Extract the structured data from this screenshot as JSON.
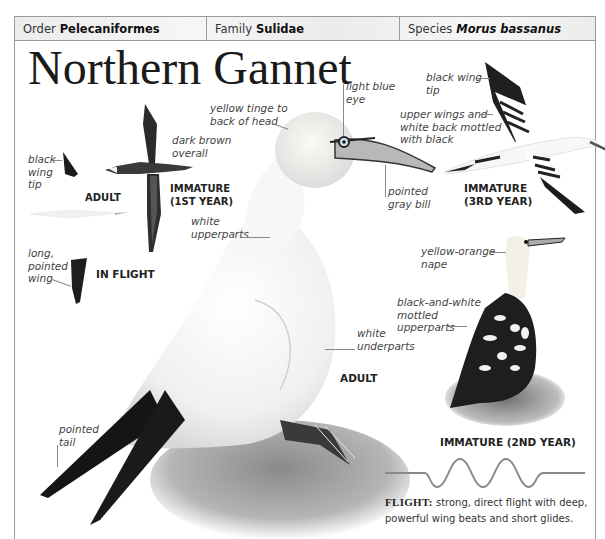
{
  "taxonomy": {
    "order_label": "Order",
    "order_value": "Pelecaniformes",
    "family_label": "Family",
    "family_value": "Sulidae",
    "species_label": "Species",
    "species_value": "Morus bassanus"
  },
  "title": "Northern Gannet",
  "in_flight": {
    "caption": "IN FLIGHT",
    "adult_caption": "ADULT",
    "immature_caption_line1": "IMMATURE",
    "immature_caption_line2": "(1ST YEAR)",
    "labels": {
      "black_wing_tip": [
        "black",
        "wing",
        "tip"
      ],
      "long_pointed_wing": [
        "long,",
        "pointed",
        "wing"
      ],
      "dark_brown_overall": [
        "dark brown",
        "overall"
      ]
    }
  },
  "adult": {
    "caption": "ADULT",
    "labels": {
      "yellow_tinge": [
        "yellow tinge to",
        "back of head"
      ],
      "light_blue_eye": [
        "light blue",
        "eye"
      ],
      "pointed_gray_bill": [
        "pointed",
        "gray bill"
      ],
      "white_upperparts": [
        "white",
        "upperparts"
      ],
      "white_underparts": [
        "white",
        "underparts"
      ],
      "pointed_tail": [
        "pointed",
        "tail"
      ]
    }
  },
  "immature_3rd": {
    "caption_line1": "IMMATURE",
    "caption_line2": "(3RD YEAR)",
    "labels": {
      "black_wing_tip": [
        "black wing",
        "tip"
      ],
      "upper_wings": [
        "upper wings and",
        "white back mottled",
        "with black"
      ]
    }
  },
  "immature_2nd": {
    "caption": "IMMATURE (2ND YEAR)",
    "labels": {
      "nape": [
        "yellow-orange",
        "nape"
      ],
      "mottled": [
        "black-and-white",
        "mottled",
        "upperparts"
      ]
    }
  },
  "flight": {
    "heading": "FLIGHT:",
    "text": "strong, direct flight with deep, powerful wing beats and short glides."
  },
  "colors": {
    "border": "#9a9a9a",
    "header_bg": "#efefef",
    "text": "#222222",
    "label": "#444444"
  }
}
